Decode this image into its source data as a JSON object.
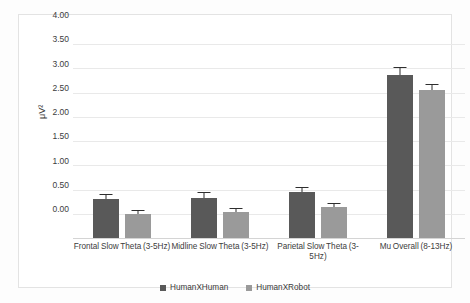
{
  "chart_data": {
    "type": "bar",
    "title": "",
    "xlabel": "",
    "ylabel": "μV²",
    "ylim": [
      0,
      4.0
    ],
    "ytick_step": 0.5,
    "ytick_labels": [
      "4.00",
      "3.50",
      "3.00",
      "2.50",
      "2.00",
      "1.50",
      "1.00",
      "0.50",
      "0.00"
    ],
    "ytick_values": [
      4.0,
      3.5,
      3.0,
      2.5,
      2.0,
      1.5,
      1.0,
      0.5,
      0.0
    ],
    "grid": true,
    "legend_position": "bottom",
    "categories": [
      "Frontal Slow Theta (3-5Hz)",
      "Midline Slow Theta (3-5Hz)",
      "Parietal Slow Theta (3-5Hz)",
      "Mu Overall (8-13Hz)"
    ],
    "series": [
      {
        "name": "HumanXHuman",
        "color": "#595959",
        "values": [
          0.8,
          0.83,
          0.95,
          3.37
        ],
        "errors": [
          0.09,
          0.09,
          0.09,
          0.13
        ]
      },
      {
        "name": "HumanXRobot",
        "color": "#9a9a9a",
        "values": [
          0.49,
          0.53,
          0.63,
          3.05
        ],
        "errors": [
          0.06,
          0.06,
          0.07,
          0.1
        ]
      }
    ],
    "annotations": [
      {
        "category": "Frontal Slow Theta (3-5Hz)",
        "text": "**",
        "value": 1.3
      },
      {
        "category": "Midline Slow Theta (3-5Hz)",
        "text": "**",
        "value": 1.3
      },
      {
        "category": "Parietal Slow Theta (3-5Hz)",
        "text": "**",
        "value": 1.3
      },
      {
        "category": "Mu Overall (8-13Hz)",
        "text": "*",
        "value": 3.8
      }
    ]
  },
  "legend": {
    "items": [
      {
        "label": "HumanXHuman"
      },
      {
        "label": "HumanXRobot"
      }
    ]
  }
}
